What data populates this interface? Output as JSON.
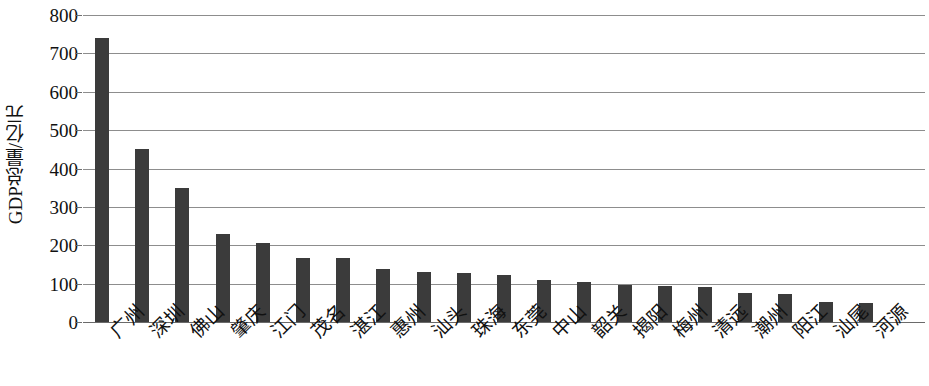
{
  "chart_data": {
    "type": "bar",
    "title": "",
    "xlabel": "",
    "ylabel": "GDP总量/亿元",
    "ylim": [
      0,
      800
    ],
    "ytick_step": 100,
    "yticks": [
      "800",
      "700",
      "600",
      "500",
      "400",
      "300",
      "200",
      "100",
      "0"
    ],
    "grid": true,
    "legend": null,
    "bar_color": "#3b3b3b",
    "categories": [
      "广州",
      "深圳",
      "佛山",
      "肇庆",
      "江门",
      "茂名",
      "湛江",
      "惠州",
      "汕头",
      "珠海",
      "东莞",
      "中山",
      "韶关",
      "揭阳",
      "梅州",
      "清远",
      "潮州",
      "阳江",
      "汕尾",
      "河源"
    ],
    "values": [
      740,
      452,
      348,
      230,
      205,
      168,
      168,
      139,
      131,
      128,
      122,
      109,
      105,
      97,
      95,
      92,
      76,
      72,
      52,
      50
    ]
  }
}
